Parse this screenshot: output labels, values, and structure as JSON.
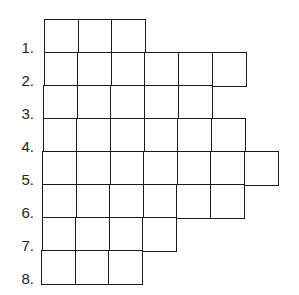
{
  "puzzle": {
    "labels": [
      "1.",
      "2.",
      "3.",
      "4.",
      "5.",
      "6.",
      "7.",
      "8."
    ],
    "rows": [
      {
        "cells": 3
      },
      {
        "cells": 6
      },
      {
        "cells": 5
      },
      {
        "cells": 6
      },
      {
        "cells": 7
      },
      {
        "cells": 6
      },
      {
        "cells": 4
      },
      {
        "cells": 3
      }
    ],
    "line_color": "#1a1a1a"
  }
}
